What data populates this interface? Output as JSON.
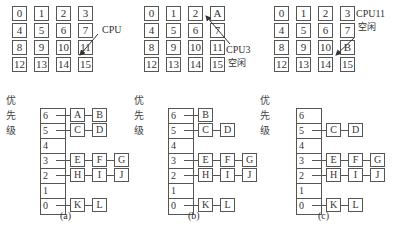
{
  "panels": [
    {
      "id": "a",
      "grid": [
        "0",
        "1",
        "2",
        "3",
        "4",
        "5",
        "6",
        "7",
        "8",
        "9",
        "10",
        "11",
        "12",
        "13",
        "14",
        "15"
      ],
      "annotation": {
        "line1": "CPU",
        "line2": ""
      },
      "priority_label": "优先级",
      "levels": [
        {
          "level": "6",
          "nodes": [
            "A",
            "B"
          ]
        },
        {
          "level": "5",
          "nodes": [
            "C",
            "D"
          ]
        },
        {
          "level": "4",
          "nodes": []
        },
        {
          "level": "3",
          "nodes": [
            "E",
            "F",
            "G"
          ]
        },
        {
          "level": "2",
          "nodes": [
            "H",
            "I",
            "J"
          ]
        },
        {
          "level": "1",
          "nodes": []
        },
        {
          "level": "0",
          "nodes": [
            "K",
            "L"
          ]
        }
      ],
      "caption": "(a)"
    },
    {
      "id": "b",
      "grid": [
        "0",
        "1",
        "2",
        "A",
        "4",
        "5",
        "6",
        "7",
        "8",
        "9",
        "10",
        "11",
        "12",
        "13",
        "14",
        "15"
      ],
      "annotation": {
        "line1": "CPU3",
        "line2": "空闲"
      },
      "priority_label": "优先级",
      "levels": [
        {
          "level": "6",
          "nodes": [
            "B"
          ]
        },
        {
          "level": "5",
          "nodes": [
            "C",
            "D"
          ]
        },
        {
          "level": "4",
          "nodes": []
        },
        {
          "level": "3",
          "nodes": [
            "E",
            "F",
            "G"
          ]
        },
        {
          "level": "2",
          "nodes": [
            "H",
            "I",
            "J"
          ]
        },
        {
          "level": "1",
          "nodes": []
        },
        {
          "level": "0",
          "nodes": [
            "K",
            "L"
          ]
        }
      ],
      "caption": "(b)"
    },
    {
      "id": "c",
      "grid": [
        "0",
        "1",
        "2",
        "3",
        "4",
        "5",
        "6",
        "7",
        "8",
        "9",
        "10",
        "B",
        "12",
        "13",
        "14",
        "15"
      ],
      "annotation": {
        "line1": "CPU11",
        "line2": "空闲"
      },
      "priority_label": "优先级",
      "levels": [
        {
          "level": "6",
          "nodes": []
        },
        {
          "level": "5",
          "nodes": [
            "C",
            "D"
          ]
        },
        {
          "level": "4",
          "nodes": []
        },
        {
          "level": "3",
          "nodes": [
            "E",
            "F",
            "G"
          ]
        },
        {
          "level": "2",
          "nodes": [
            "H",
            "I",
            "J"
          ]
        },
        {
          "level": "1",
          "nodes": []
        },
        {
          "level": "0",
          "nodes": [
            "K",
            "L"
          ]
        }
      ],
      "caption": "(c)"
    }
  ]
}
